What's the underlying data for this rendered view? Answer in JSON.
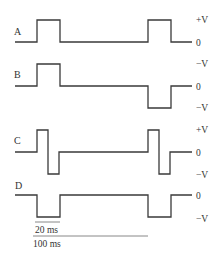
{
  "traces": [
    {
      "id": "A",
      "label": "A",
      "levels": [
        "+V",
        "0"
      ],
      "kind": "positive"
    },
    {
      "id": "B",
      "label": "B",
      "levels": [
        "−V",
        "0",
        "−V"
      ],
      "kind": "positive-then-negative"
    },
    {
      "id": "C",
      "label": "C",
      "levels": [
        "+V",
        "0",
        "−V"
      ],
      "kind": "bipolar"
    },
    {
      "id": "D",
      "label": "D",
      "levels": [
        "0",
        "−V"
      ],
      "kind": "negative"
    }
  ],
  "scale": {
    "pulse_width_label": "20 ms",
    "period_label": "100 ms"
  },
  "colors": {
    "trace": "#3a3a3a",
    "text": "#333333",
    "background": "#ffffff"
  }
}
